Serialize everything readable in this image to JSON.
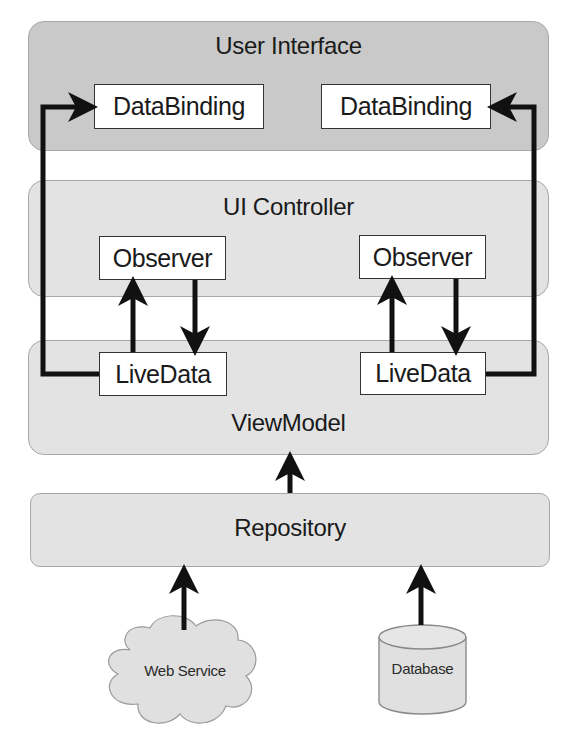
{
  "diagram": {
    "colors": {
      "ui_layer": "#c9c9c9",
      "light_layer": "#e3e3e3",
      "node_fill": "#ffffff",
      "arrow": "#111111",
      "border": "#a8a8a8"
    },
    "layers": {
      "user_interface": {
        "label": "User Interface",
        "nodes": [
          {
            "label": "DataBinding"
          },
          {
            "label": "DataBinding"
          }
        ]
      },
      "ui_controller": {
        "label": "UI Controller",
        "nodes": [
          {
            "label": "Observer"
          },
          {
            "label": "Observer"
          }
        ]
      },
      "viewmodel": {
        "label": "ViewModel",
        "nodes": [
          {
            "label": "LiveData"
          },
          {
            "label": "LiveData"
          }
        ]
      },
      "repository": {
        "label": "Repository"
      }
    },
    "sources": [
      {
        "label": "Web Service",
        "shape": "cloud-icon"
      },
      {
        "label": "Database",
        "shape": "database-cylinder-icon"
      }
    ],
    "edges": [
      {
        "from": "LiveData (left)",
        "to": "DataBinding (left)"
      },
      {
        "from": "LiveData (right)",
        "to": "DataBinding (right)"
      },
      {
        "from": "LiveData (left)",
        "to": "Observer (left)"
      },
      {
        "from": "Observer (left)",
        "to": "LiveData (left)"
      },
      {
        "from": "LiveData (right)",
        "to": "Observer (right)"
      },
      {
        "from": "Observer (right)",
        "to": "LiveData (right)"
      },
      {
        "from": "Repository",
        "to": "ViewModel"
      },
      {
        "from": "Web Service",
        "to": "Repository"
      },
      {
        "from": "Database",
        "to": "Repository"
      }
    ]
  }
}
